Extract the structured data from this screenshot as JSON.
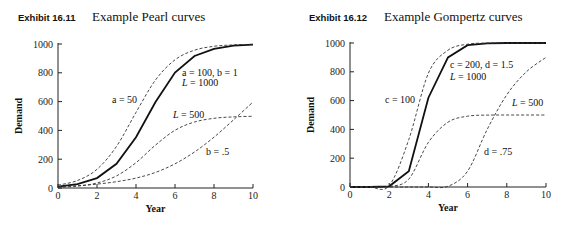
{
  "chart_data": [
    {
      "type": "line",
      "exhibit": "Exhibit 16.11",
      "title": "Example Pearl curves",
      "xlabel": "Year",
      "ylabel": "Demand",
      "xlim": [
        0,
        10
      ],
      "ylim": [
        0,
        1000
      ],
      "xticks": [
        0,
        2,
        4,
        6,
        8,
        10
      ],
      "yticks": [
        0,
        200,
        400,
        600,
        800,
        1000
      ],
      "x": [
        0,
        1,
        2,
        3,
        4,
        5,
        6,
        7,
        8,
        9,
        10
      ],
      "series": [
        {
          "name": "a = 100, b = 1, L = 1000",
          "style": "solid",
          "values": [
            10,
            27,
            69,
            168,
            353,
            597,
            802,
            917,
            967,
            988,
            995
          ]
        },
        {
          "name": "a = 50",
          "style": "dashed",
          "values": [
            20,
            52,
            130,
            289,
            525,
            750,
            890,
            957,
            984,
            994,
            998
          ]
        },
        {
          "name": "L = 500",
          "style": "dashed",
          "values": [
            5,
            13,
            35,
            84,
            176,
            298,
            401,
            458,
            484,
            494,
            498
          ]
        },
        {
          "name": "b = .5",
          "style": "dashed",
          "values": [
            10,
            16,
            27,
            44,
            69,
            108,
            168,
            250,
            353,
            473,
            597
          ]
        }
      ],
      "annotations": [
        "a = 50",
        "a = 100, b = 1",
        "L = 1000",
        "L = 500",
        "b = .5"
      ]
    },
    {
      "type": "line",
      "exhibit": "Exhibit 16.12",
      "title": "Example Gompertz curves",
      "xlabel": "Year",
      "ylabel": "Demand",
      "xlim": [
        0,
        10
      ],
      "ylim": [
        0,
        1000
      ],
      "xticks": [
        0,
        2,
        4,
        6,
        8,
        10
      ],
      "yticks": [
        0,
        200,
        400,
        600,
        800,
        1000
      ],
      "x": [
        0,
        1,
        2,
        3,
        4,
        5,
        6,
        7,
        8,
        9,
        10
      ],
      "series": [
        {
          "name": "c = 200, d = 1.5, L = 1000",
          "style": "solid",
          "values": [
            0,
            0,
            5,
            110,
            620,
            900,
            985,
            998,
            1000,
            1000,
            1000
          ]
        },
        {
          "name": "c = 100",
          "style": "dashed",
          "values": [
            0,
            0,
            10,
            330,
            790,
            950,
            992,
            999,
            1000,
            1000,
            1000
          ]
        },
        {
          "name": "L = 500",
          "style": "dashed",
          "values": [
            0,
            0,
            3,
            55,
            310,
            450,
            492,
            499,
            500,
            500,
            500
          ]
        },
        {
          "name": "d = .75",
          "style": "dashed",
          "values": [
            0,
            0,
            0,
            0,
            0,
            5,
            110,
            400,
            640,
            800,
            900
          ]
        }
      ],
      "annotations": [
        "c = 100",
        "c = 200, d = 1.5",
        "L = 1000",
        "L = 500",
        "d = .75"
      ]
    }
  ],
  "labels": {
    "left_exhibit": "Exhibit 16.11",
    "left_title": "Example Pearl curves",
    "right_exhibit": "Exhibit 16.12",
    "right_title": "Example Gompertz curves",
    "xlabel": "Year",
    "ylabel": "Demand",
    "left_ann": [
      "a = 50",
      "a = 100, b = 1",
      "L = 1000",
      "L = 500",
      "b = .5"
    ],
    "right_ann": [
      "c = 100",
      "c = 200, d = 1.5",
      "L = 1000",
      "L = 500",
      "d = .75"
    ]
  }
}
